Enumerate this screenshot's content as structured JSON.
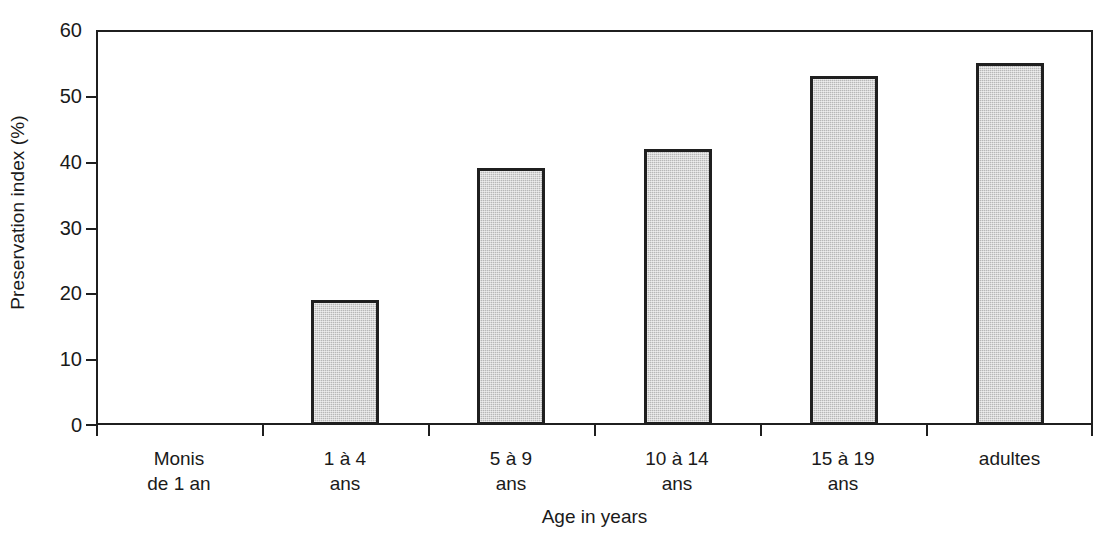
{
  "chart_data": {
    "type": "bar",
    "title": "",
    "xlabel": "Age in years",
    "ylabel": "Preservation index (%)",
    "ylim": [
      0,
      60
    ],
    "ytick_step": 10,
    "yticks": [
      0,
      10,
      20,
      30,
      40,
      50,
      60
    ],
    "ytick_labels": [
      "0",
      "10",
      "20",
      "30",
      "40",
      "50",
      "60"
    ],
    "grid": false,
    "legend": null,
    "bar_fill_color": "#c2c2c2",
    "bar_border_color": "#1f1f1f",
    "axis_color": "#1f1f1f",
    "background_color": "#ffffff",
    "categories": [
      "Monis de 1 an",
      "1 à 4 ans",
      "5 à 9 ans",
      "10 à 14 ans",
      "15 à 19 ans",
      "adultes"
    ],
    "category_lines": [
      [
        "Monis",
        "de 1 an"
      ],
      [
        "1 à 4",
        "ans"
      ],
      [
        "5 à 9",
        "ans"
      ],
      [
        "10 à 14",
        "ans"
      ],
      [
        "15 à 19",
        "ans"
      ],
      [
        "adultes",
        ""
      ]
    ],
    "values": [
      0,
      19,
      39,
      42,
      53,
      55
    ]
  },
  "axes": {
    "y_title": "Preservation index (%)",
    "x_title": "Age in years"
  },
  "y_tick_labels": {
    "t0": "0",
    "t10": "10",
    "t20": "20",
    "t30": "30",
    "t40": "40",
    "t50": "50",
    "t60": "60"
  },
  "x_labels": {
    "c0_l1": "Monis",
    "c0_l2": "de 1 an",
    "c1_l1": "1 à 4",
    "c1_l2": "ans",
    "c2_l1": "5 à 9",
    "c2_l2": "ans",
    "c3_l1": "10 à 14",
    "c3_l2": "ans",
    "c4_l1": "15 à 19",
    "c4_l2": "ans",
    "c5_l1": "adultes",
    "c5_l2": ""
  }
}
